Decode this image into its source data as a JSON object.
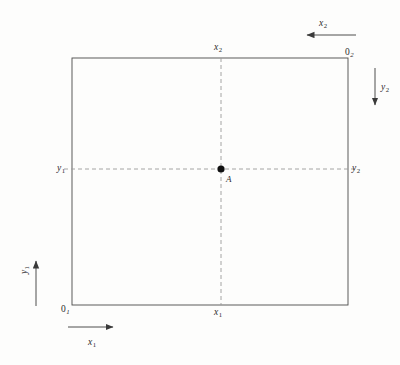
{
  "diagram": {
    "type": "edgeworth-box",
    "title": "",
    "box": {
      "left": 72,
      "top": 58,
      "right": 348,
      "bottom": 305,
      "width": 276,
      "height": 247,
      "stroke_color": "#4a4a4a",
      "stroke_width": 0.9
    },
    "dashed": {
      "color": "#9a9a9a",
      "stroke_width": 0.9,
      "dash_pattern": "4,3"
    },
    "point": {
      "label": "A",
      "x": 221,
      "y": 169,
      "radius": 3.6,
      "color": "#111111"
    },
    "corner_labels": [
      {
        "id": "origin-1",
        "text": "0",
        "sub": "1",
        "x": 61,
        "y": 304
      },
      {
        "id": "origin-2",
        "text": "0",
        "sub": "2",
        "x": 345,
        "y": 47
      }
    ],
    "axis_labels_on_box": [
      {
        "id": "x2-top",
        "text": "x",
        "sub": "2",
        "x": 214,
        "y": 42
      },
      {
        "id": "x1-bottom",
        "text": "x",
        "sub": "1",
        "x": 214,
        "y": 307
      },
      {
        "id": "y1-left",
        "text": "y",
        "sub": "1",
        "x": 57,
        "y": 163
      },
      {
        "id": "y2-right",
        "text": "y",
        "sub": "2",
        "x": 352,
        "y": 163
      }
    ],
    "direction_arrows": [
      {
        "id": "x1-arrow",
        "label_text": "x",
        "label_sub": "1",
        "direction": "right",
        "x1": 68,
        "y1": 327,
        "x2": 118,
        "y2": 327,
        "label_x": 88,
        "label_y": 337
      },
      {
        "id": "y1-arrow",
        "label_text": "y",
        "label_sub": "1",
        "direction": "up",
        "x1": 36,
        "y1": 306,
        "x2": 36,
        "y2": 255,
        "label_x": 19,
        "label_y": 274
      },
      {
        "id": "x2-arrow",
        "label_text": "x",
        "label_sub": "2",
        "direction": "left",
        "x1": 356,
        "y1": 35,
        "x2": 301,
        "y2": 35,
        "label_x": 319,
        "label_y": 18
      },
      {
        "id": "y2-arrow",
        "label_text": "y",
        "label_sub": "2",
        "direction": "down",
        "x1": 375,
        "y1": 68,
        "x2": 375,
        "y2": 111,
        "label_x": 381,
        "label_y": 82
      }
    ],
    "colors": {
      "background": "#fdfdfc",
      "box_line": "#4a4a4a",
      "dashed_line": "#9a9a9a",
      "arrow_line": "#3a3a3a",
      "text": "#2c2c2c",
      "point_fill": "#111111"
    }
  }
}
